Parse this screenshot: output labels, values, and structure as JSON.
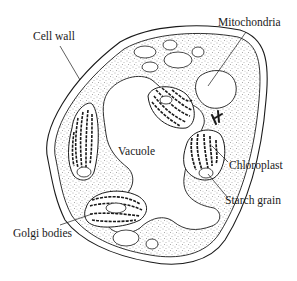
{
  "diagram": {
    "type": "plant-cell-cross-section",
    "colors": {
      "ink": "#1a1a1a",
      "background": "#ffffff",
      "stipple": "#555555"
    },
    "labels": {
      "cell_wall": "Cell wall",
      "mitochondria": "Mitochondria",
      "vacuole": "Vacuole",
      "chloroplast": "Chloroplast",
      "starch_grain": "Starch grain",
      "golgi_bodies": "Golgi bodies"
    }
  }
}
